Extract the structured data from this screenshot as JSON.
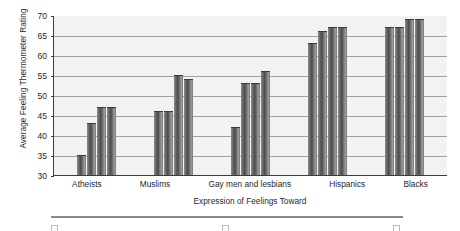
{
  "chart_data": {
    "type": "bar",
    "title": "",
    "xlabel": "Expression of Feelings Toward",
    "ylabel": "Average Feeling Thermometer Rating",
    "ylim": [
      30,
      70
    ],
    "yticks": [
      30,
      35,
      40,
      45,
      50,
      55,
      60,
      65,
      70
    ],
    "grid": true,
    "legend_position": "bottom",
    "categories": [
      "Atheists",
      "Muslims",
      "Gay men and lesbians",
      "Hispanics",
      "Blacks"
    ],
    "series": [
      {
        "name": "Series 1",
        "values": [
          35,
          46,
          42,
          63,
          67
        ]
      },
      {
        "name": "Series 2",
        "values": [
          43,
          46,
          53,
          66,
          67
        ]
      },
      {
        "name": "Series 3",
        "values": [
          47,
          55,
          53,
          67,
          69
        ]
      },
      {
        "name": "Series 4",
        "values": [
          47,
          54,
          56,
          67,
          69
        ]
      }
    ],
    "bar_color": "#6d6d6d",
    "plot_background": "#f2f2f0",
    "gridline_color": "#6f6f6f",
    "axis_color": "#3c3c3c"
  },
  "legend": {
    "items": [
      {
        "label": ""
      },
      {
        "label": ""
      },
      {
        "label": ""
      }
    ]
  }
}
